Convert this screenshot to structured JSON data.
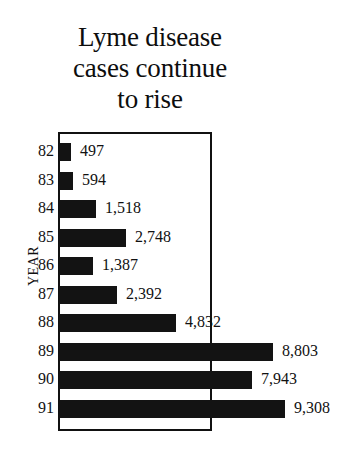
{
  "title": {
    "line1": "Lyme disease",
    "line2": "cases continue",
    "line3": "to rise"
  },
  "axis": {
    "y_title": "YEAR"
  },
  "colors": {
    "bar": "#131313",
    "frame": "#111111",
    "text": "#111111",
    "background": "#ffffff"
  },
  "chart_data": {
    "type": "bar",
    "orientation": "horizontal",
    "title": "Lyme disease cases continue to rise",
    "xlabel": "",
    "ylabel": "YEAR",
    "grid": false,
    "legend": null,
    "xlim": [
      0,
      9308
    ],
    "categories": [
      "82",
      "83",
      "84",
      "85",
      "86",
      "87",
      "88",
      "89",
      "90",
      "91"
    ],
    "values": [
      497,
      594,
      1518,
      2748,
      1387,
      2392,
      4832,
      8803,
      7943,
      9308
    ],
    "value_labels": [
      "497",
      "594",
      "1,518",
      "2,748",
      "1,387",
      "2,392",
      "4,832",
      "8,803",
      "7,943",
      "9,308"
    ],
    "bars": [
      {
        "year": "82",
        "value": 497,
        "label": "497"
      },
      {
        "year": "83",
        "value": 594,
        "label": "594"
      },
      {
        "year": "84",
        "value": 1518,
        "label": "1,518"
      },
      {
        "year": "85",
        "value": 2748,
        "label": "2,748"
      },
      {
        "year": "86",
        "value": 1387,
        "label": "1,387"
      },
      {
        "year": "87",
        "value": 2392,
        "label": "2,392"
      },
      {
        "year": "88",
        "value": 4832,
        "label": "4,832"
      },
      {
        "year": "89",
        "value": 8803,
        "label": "8,803"
      },
      {
        "year": "90",
        "value": 7943,
        "label": "7,943"
      },
      {
        "year": "91",
        "value": 9308,
        "label": "9,308"
      }
    ]
  },
  "layout": {
    "plot_left_px": 59,
    "plot_top_px": 132,
    "plot_width_px": 154,
    "plot_height_px": 299,
    "row_pitch_px": 28.5,
    "row_first_top_px": 11,
    "bar_height_px": 18,
    "px_per_case": 0.02428,
    "value_gap_px": 9
  }
}
